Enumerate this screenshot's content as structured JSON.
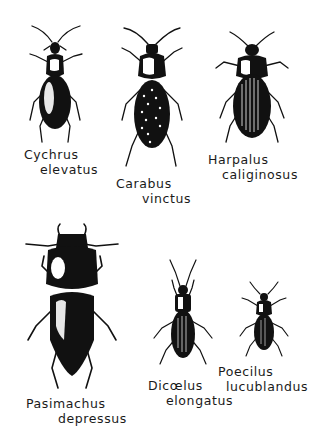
{
  "illustration": {
    "subject": "ground beetles (Carabidae)",
    "ink_color": "#111111",
    "background": "#ffffff",
    "specimens": [
      {
        "genus": "Cychrus",
        "species": "elevatus",
        "position": "top-left"
      },
      {
        "genus": "Carabus",
        "species": "vinctus",
        "position": "top-center"
      },
      {
        "genus": "Harpalus",
        "species": "caliginosus",
        "position": "top-right"
      },
      {
        "genus": "Pasimachus",
        "species": "depressus",
        "position": "bottom-left"
      },
      {
        "genus": "Dicaelus",
        "species": "elongatus",
        "position": "bottom-center",
        "display_genus": "Dicœlus"
      },
      {
        "genus": "Poecilus",
        "species": "lucublandus",
        "position": "bottom-right"
      }
    ]
  },
  "labels": {
    "cychrus": {
      "l1": "Cychrus",
      "l2": "elevatus"
    },
    "carabus": {
      "l1": "Carabus",
      "l2": "vinctus"
    },
    "harpalus": {
      "l1": "Harpalus",
      "l2": "caliginosus"
    },
    "pasimachus": {
      "l1": "Pasimachus",
      "l2": "depressus"
    },
    "dicaelus": {
      "l1": "Dicœlus",
      "l2": "elongatus"
    },
    "poecilus": {
      "l1": "Poecilus",
      "l2": "lucublandus"
    }
  }
}
